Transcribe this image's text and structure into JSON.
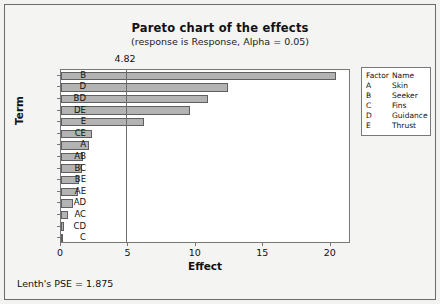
{
  "chart_data": {
    "type": "bar",
    "orientation": "horizontal",
    "title": "Pareto chart of the effects",
    "subtitle": "(response is Response, Alpha = 0.05)",
    "xlabel": "Effect",
    "ylabel": "Term",
    "categories": [
      "B",
      "D",
      "BD",
      "DE",
      "E",
      "CE",
      "A",
      "AB",
      "BC",
      "BE",
      "AE",
      "AD",
      "AC",
      "CD",
      "C"
    ],
    "values": [
      20.4,
      12.4,
      10.9,
      9.6,
      6.15,
      2.3,
      2.05,
      1.6,
      1.55,
      1.3,
      1.25,
      0.9,
      0.55,
      0.2,
      0.05
    ],
    "xlim": [
      0,
      21.5
    ],
    "xticks": [
      0,
      5,
      10,
      15,
      20
    ],
    "xtick_labels": [
      "0",
      "5",
      "10",
      "15",
      "20"
    ],
    "grid": false,
    "reference_line": {
      "value": 4.82,
      "label": "4.82"
    },
    "bar_fill": "#b3b3b3",
    "bar_edge": "#5f5f5f",
    "legend_position": "right"
  },
  "legend": {
    "headers": {
      "factor": "Factor",
      "name": "Name"
    },
    "rows": [
      {
        "factor": "A",
        "name": "Skin"
      },
      {
        "factor": "B",
        "name": "Seeker"
      },
      {
        "factor": "C",
        "name": "Fins"
      },
      {
        "factor": "D",
        "name": "Guidance"
      },
      {
        "factor": "E",
        "name": "Thrust"
      }
    ]
  },
  "footer": {
    "note": "Lenth's PSE = 1.875"
  }
}
